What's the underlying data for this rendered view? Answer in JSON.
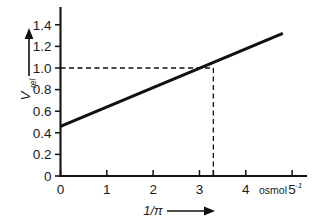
{
  "chart_data": {
    "type": "line",
    "title": "",
    "subtitle": "",
    "xlabel": "1/π",
    "xlabel_arrow": "→",
    "ylabel": "V",
    "ylabel_subscript": "rel",
    "ylabel_arrow": "↑",
    "xunit": "osmol",
    "xunit_exponent": "-1",
    "xlim": [
      0,
      5.3
    ],
    "ylim": [
      0,
      1.5
    ],
    "xticks": [
      0,
      1,
      2,
      3,
      4,
      5
    ],
    "xtick_labels": [
      "0",
      "1",
      "2",
      "3",
      "4",
      "5"
    ],
    "yticks": [
      0,
      0.2,
      0.4,
      0.6,
      0.8,
      1.0,
      1.2,
      1.4
    ],
    "ytick_labels": [
      "0",
      "0.2",
      "0.4",
      "0.6",
      "0.8",
      "1.0",
      "1.2",
      "1.4"
    ],
    "grid": false,
    "legend": false,
    "line_color": "#111111",
    "series": [
      {
        "name": "V_rel vs 1/π",
        "x": [
          0,
          4.8
        ],
        "y": [
          0.46,
          1.32
        ],
        "slope": 0.18,
        "intercept": 0.46
      }
    ],
    "annotations": [
      {
        "name": "reference-intersection",
        "style": "dashed",
        "x": 3.3,
        "y": 1.0,
        "horizontal_from_x": 0,
        "vertical_to_y": 0
      }
    ],
    "extra_xtick": 3.3
  },
  "figure": {
    "caption": ""
  }
}
